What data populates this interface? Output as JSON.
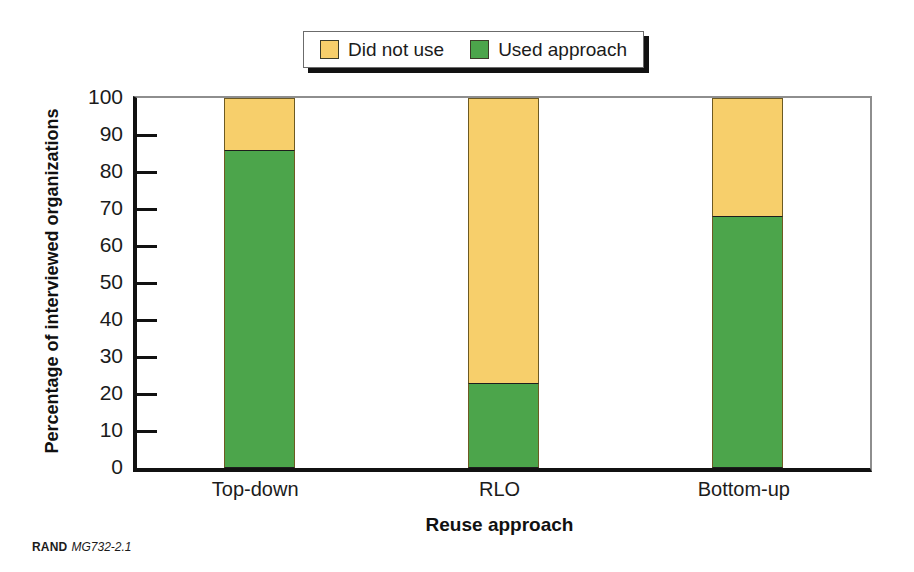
{
  "legend": {
    "position": "top-center",
    "items": [
      {
        "label": "Did not use",
        "color": "#F7CF6B",
        "icon": "square-swatch-icon"
      },
      {
        "label": "Used approach",
        "color": "#4CA54B",
        "icon": "square-swatch-icon"
      }
    ]
  },
  "footer": {
    "brand": "RAND",
    "code": "MG732-2.1"
  },
  "chart_data": {
    "type": "bar",
    "stacked": true,
    "title": "",
    "subtitle": "",
    "xlabel": "Reuse approach",
    "ylabel": "Percentage of interviewed organizations",
    "categories": [
      "Top-down",
      "RLO",
      "Bottom-up"
    ],
    "series": [
      {
        "name": "Used approach",
        "color": "#4CA54B",
        "values": [
          86,
          23,
          68
        ]
      },
      {
        "name": "Did not use",
        "color": "#F7CF6B",
        "values": [
          14,
          77,
          32
        ]
      }
    ],
    "ylim": [
      0,
      100
    ],
    "ytick_step": 10,
    "yticks": [
      0,
      10,
      20,
      30,
      40,
      50,
      60,
      70,
      80,
      90,
      100
    ],
    "ytick_labels": [
      "0",
      "10",
      "20",
      "30",
      "40",
      "50",
      "60",
      "70",
      "80",
      "90",
      "100"
    ],
    "grid": false,
    "legend_position": "top-center",
    "annotations": []
  }
}
